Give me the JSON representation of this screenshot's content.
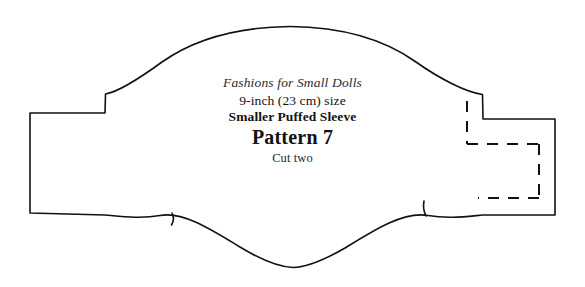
{
  "sheet": {
    "title": "Smaller Puffed Sleeve pattern sheet",
    "background_color": "#ffffff",
    "ink_color": "#111111",
    "width": 585,
    "height": 287
  },
  "label": {
    "brand": "Fashions for Small Dolls",
    "size": "9-inch (23 cm) size",
    "piece_name": "Smaller Puffed Sleeve",
    "pattern_number": "Pattern 7",
    "cut_instruction": "Cut two"
  },
  "pattern": {
    "piece_type": "puffed sleeve",
    "outline_color": "#111111",
    "outline_width": 1.6,
    "dashed_color": "#111111",
    "dashed_width": 2.0,
    "dash_pattern": "11 9",
    "notch_count": 2,
    "outline_path": "M 30 113 L 105 113 L 105.5 94 C 118 92 140 78 162 62 C 196 38 240 27 290 26.5 C 340 27 384 39 416 62 C 440 79 466 92 482.5 94.5 L 483 119 L 555 119 L 555 215 L 483 215 C 466 216.5 448 219 428 215.5 C 404 211 374 230 345 248 C 326 259 309 267 293 267.5 C 276 267 258 258 240 247 C 212 230 183 211 160 215.5 C 141 219 122 216.5 105 215 L 30 213 Z",
    "dashed_segments": [
      {
        "name": "fold-line-left-vertical",
        "x1": 467,
        "y1": 101,
        "x2": 467,
        "y2": 144
      },
      {
        "name": "fold-line-top-horizontal",
        "x1": 467,
        "y1": 144,
        "x2": 539,
        "y2": 144
      },
      {
        "name": "fold-line-right-vertical",
        "x1": 539,
        "y1": 144,
        "x2": 539,
        "y2": 198
      },
      {
        "name": "fold-line-bottom-horizontal",
        "x1": 539,
        "y1": 198,
        "x2": 478,
        "y2": 198
      }
    ],
    "notches": [
      {
        "name": "notch-left",
        "path": "M 172 213 C 174 217 174 221 171.5 225"
      },
      {
        "name": "notch-right",
        "path": "M 424 201 C 423 206 423.5 211 426 216"
      }
    ]
  }
}
